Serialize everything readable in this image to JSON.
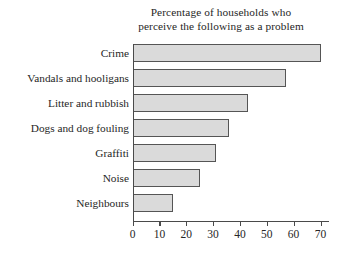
{
  "chart_data": {
    "type": "bar",
    "orientation": "horizontal",
    "title": "Percentage of households who perceive the following as a problem",
    "title_lines": [
      "Percentage of households who",
      "perceive the following as a problem"
    ],
    "categories": [
      "Crime",
      "Vandals and hooligans",
      "Litter and rubbish",
      "Dogs and dog fouling",
      "Graffiti",
      "Noise",
      "Neighbours"
    ],
    "values": [
      70,
      57,
      43,
      36,
      31,
      25,
      15
    ],
    "xlabel": "",
    "ylabel": "",
    "xlim": [
      0,
      70
    ],
    "xticks": [
      0,
      10,
      20,
      30,
      40,
      50,
      60,
      70
    ],
    "xtick_labels": [
      "0",
      "10",
      "20",
      "30",
      "40",
      "50",
      "60",
      "70"
    ],
    "grid": false,
    "legend": null,
    "bar_fill_color": "#dadada",
    "bar_edge_color": "#555555",
    "axis_color": "#4a4a4a",
    "text_color": "#262626",
    "background_color": "#ffffff"
  }
}
